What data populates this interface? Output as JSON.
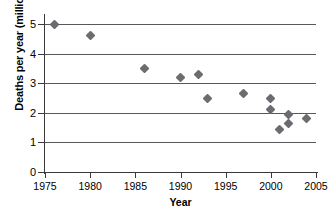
{
  "chart_data": {
    "type": "scatter",
    "title": "",
    "xlabel": "Year",
    "ylabel": "Deaths per year (millions)",
    "xlim": [
      1975,
      2005
    ],
    "ylim": [
      0,
      5
    ],
    "xticks": [
      1975,
      1980,
      1985,
      1990,
      1995,
      2000,
      2005
    ],
    "yticks": [
      0,
      1,
      2,
      3,
      4,
      5
    ],
    "grid": "horizontal",
    "gridlines": [
      1,
      2,
      3,
      4,
      5
    ],
    "legend": "none",
    "marker": "diamond",
    "marker_color": "#6b6b70",
    "x": [
      1976,
      1980,
      1986,
      1990,
      1992,
      1993,
      1997,
      2000,
      2000,
      2001,
      2002,
      2002,
      2004
    ],
    "y": [
      5.0,
      4.6,
      3.5,
      3.2,
      3.3,
      2.5,
      2.65,
      2.5,
      2.1,
      1.45,
      1.95,
      1.65,
      1.8
    ],
    "points": [
      {
        "x": 1976,
        "y": 5.0
      },
      {
        "x": 1980,
        "y": 4.6
      },
      {
        "x": 1986,
        "y": 3.5
      },
      {
        "x": 1990,
        "y": 3.2
      },
      {
        "x": 1992,
        "y": 3.3
      },
      {
        "x": 1993,
        "y": 2.5
      },
      {
        "x": 1997,
        "y": 2.65
      },
      {
        "x": 2000,
        "y": 2.5
      },
      {
        "x": 2000,
        "y": 2.1
      },
      {
        "x": 2001,
        "y": 1.45
      },
      {
        "x": 2002,
        "y": 1.95
      },
      {
        "x": 2002,
        "y": 1.65
      },
      {
        "x": 2004,
        "y": 1.8
      }
    ]
  },
  "axis_color": "#3a3a3c",
  "grid_color": "#58585a"
}
